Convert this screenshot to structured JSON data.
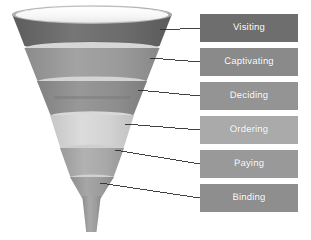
{
  "diagram": {
    "type": "funnel",
    "background_color": "#ffffff",
    "stage_count": 6
  },
  "funnel": {
    "rim": {
      "name": "funnel-rim",
      "outer_color": "#b9b9b9",
      "inner_color": "#fbfbfb",
      "highlight_color": "#ffffff"
    },
    "divider_color": "#d7d7d7",
    "stem": {
      "name": "funnel-stem",
      "color": "#9d9d9d"
    },
    "bands": [
      {
        "stage": "Visiting",
        "color": "#6d6d6d",
        "shade_color": "#5f5f5f"
      },
      {
        "stage": "Captivating",
        "color": "#9a9a9a",
        "shade_color": "#8c8c8c"
      },
      {
        "stage": "Deciding",
        "color": "#8f8f8f",
        "shade_color": "#828282"
      },
      {
        "stage": "Ordering",
        "color": "#d2d2d2",
        "shade_color": "#c4c4c4"
      },
      {
        "stage": "Paying",
        "color": "#a9a9a9",
        "shade_color": "#9b9b9b"
      },
      {
        "stage": "Binding",
        "color": "#9d9d9d",
        "shade_color": "#8f8f8f"
      }
    ]
  },
  "connectors": {
    "name": "leader-lines",
    "color": "#2c2c2c",
    "width": 0.9,
    "lines": [
      {
        "stage": "Visiting",
        "x1": 160,
        "y1": 30,
        "x2": 200,
        "y2": 28
      },
      {
        "stage": "Captivating",
        "x1": 150,
        "y1": 58,
        "x2": 200,
        "y2": 62
      },
      {
        "stage": "Deciding",
        "x1": 138,
        "y1": 90,
        "x2": 200,
        "y2": 96
      },
      {
        "stage": "Ordering",
        "x1": 125,
        "y1": 124,
        "x2": 200,
        "y2": 130
      },
      {
        "stage": "Paying",
        "x1": 115,
        "y1": 150,
        "x2": 200,
        "y2": 164
      },
      {
        "stage": "Binding",
        "x1": 100,
        "y1": 183,
        "x2": 200,
        "y2": 198
      }
    ]
  },
  "labels": {
    "box_left": 200,
    "box_width": 98,
    "box_height": 28,
    "box_pitch": 34,
    "first_box_top": 14,
    "text_color": "#ffffff",
    "items": [
      {
        "text": "Visiting",
        "bg": "#6e6e6e",
        "top": 14
      },
      {
        "text": "Captivating",
        "bg": "#8a8a8a",
        "top": 48
      },
      {
        "text": "Deciding",
        "bg": "#949494",
        "top": 82
      },
      {
        "text": "Ordering",
        "bg": "#aaaaaa",
        "top": 116
      },
      {
        "text": "Paying",
        "bg": "#999999",
        "top": 150
      },
      {
        "text": "Binding",
        "bg": "#8e8e8e",
        "top": 184
      }
    ]
  }
}
